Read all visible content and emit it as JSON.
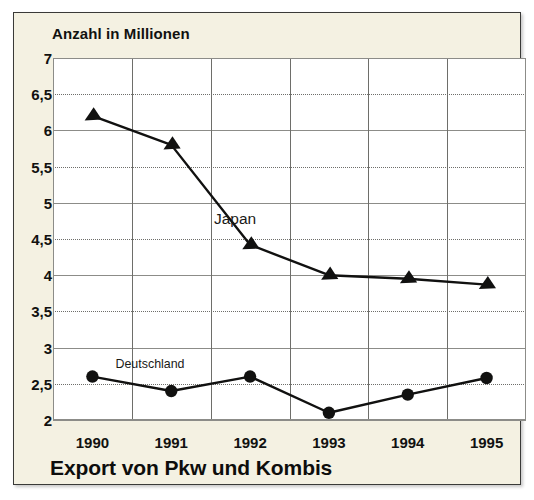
{
  "figure": {
    "background_color": "#f4f1e2",
    "plot_background_color": "#ffffff",
    "border_color": "#3a3a38"
  },
  "chart_data": {
    "type": "line",
    "title": "Export von Pkw und Kombis",
    "ylabel": "Anzahl in Millionen",
    "xlabel": "",
    "categories": [
      "1990",
      "1991",
      "1992",
      "1993",
      "1994",
      "1995"
    ],
    "ylim": [
      2,
      7
    ],
    "ytick_labels": [
      "7",
      "6,5",
      "6",
      "5,5",
      "5",
      "4,5",
      "4",
      "3,5",
      "3",
      "2,5",
      "2"
    ],
    "ytick_values": [
      7,
      6.5,
      6,
      5.5,
      5,
      4.5,
      4,
      3.5,
      3,
      2.5,
      2
    ],
    "grid": {
      "major_horizontal": "solid",
      "minor_horizontal": "dotted",
      "vertical": "solid",
      "vertical_between_categories": true
    },
    "legend": "inline-labels",
    "series": [
      {
        "name": "Japan",
        "marker": "triangle",
        "color": "#111110",
        "values": [
          6.2,
          5.8,
          4.42,
          4.0,
          3.95,
          3.87
        ],
        "label_position": {
          "x": 0.385,
          "y": 4.78
        }
      },
      {
        "name": "Deutschland",
        "marker": "circle",
        "color": "#111110",
        "values": [
          2.6,
          2.4,
          2.6,
          2.1,
          2.35,
          2.58
        ],
        "label_position": {
          "x": 0.205,
          "y": 2.79
        }
      }
    ]
  }
}
